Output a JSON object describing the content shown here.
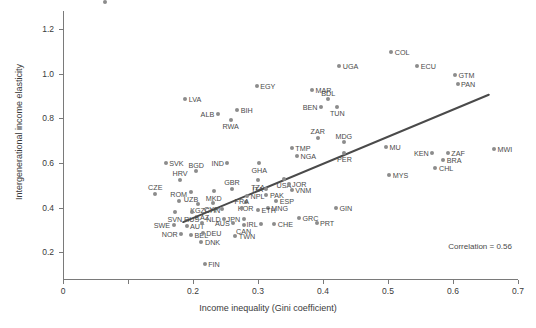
{
  "chart_data": {
    "type": "scatter",
    "title": "",
    "xlabel": "Income inequality (Gini coefficient)",
    "ylabel": "Intergenerational income elasticity",
    "xlim": [
      0.0,
      0.7
    ],
    "ylim": [
      0.08,
      1.28
    ],
    "xticks": [
      0.0,
      0.1,
      0.2,
      0.3,
      0.4,
      0.5,
      0.6,
      0.7
    ],
    "xtick_labels": [
      "0",
      "",
      "0.2",
      "0.3",
      "0.4",
      "0.5",
      "0.6",
      "0.7"
    ],
    "yticks": [
      0.2,
      0.4,
      0.6,
      0.8,
      1.0,
      1.2
    ],
    "ytick_labels": [
      "0.2",
      "0.4",
      "0.6",
      "0.8",
      "1.0",
      "1.2"
    ],
    "grid": false,
    "legend": "none",
    "annotation": "Correlation = 0.56",
    "correlation": 0.56,
    "marker_color": "#8c8c8c",
    "trend_color": "#4a4a4a",
    "axis_color": "#7a7a7a",
    "trend_line": {
      "x0": 0.185,
      "y0": 0.335,
      "x1": 0.655,
      "y1": 0.905
    },
    "points": [
      {
        "label": "COL",
        "x": 0.505,
        "y": 1.095,
        "lp": "r"
      },
      {
        "label": "UGA",
        "x": 0.425,
        "y": 1.035,
        "lp": "r"
      },
      {
        "label": "ECU",
        "x": 0.545,
        "y": 1.035,
        "lp": "r"
      },
      {
        "label": "GTM",
        "x": 0.603,
        "y": 0.995,
        "lp": "r"
      },
      {
        "label": "PAN",
        "x": 0.607,
        "y": 0.955,
        "lp": "r"
      },
      {
        "label": "EGY",
        "x": 0.298,
        "y": 0.945,
        "lp": "r"
      },
      {
        "label": "MAR",
        "x": 0.383,
        "y": 0.928,
        "lp": "r"
      },
      {
        "label": "LVA",
        "x": 0.188,
        "y": 0.888,
        "lp": "r"
      },
      {
        "label": "BDL",
        "x": 0.408,
        "y": 0.885,
        "lp": "t"
      },
      {
        "label": "BEN",
        "x": 0.397,
        "y": 0.852,
        "lp": "l"
      },
      {
        "label": "TUN",
        "x": 0.422,
        "y": 0.852,
        "lp": "b"
      },
      {
        "label": "BIH",
        "x": 0.268,
        "y": 0.835,
        "lp": "r"
      },
      {
        "label": "ALB",
        "x": 0.238,
        "y": 0.818,
        "lp": "l"
      },
      {
        "label": "RWA",
        "x": 0.258,
        "y": 0.792,
        "lp": "b"
      },
      {
        "label": "ZAR",
        "x": 0.392,
        "y": 0.712,
        "lp": "t"
      },
      {
        "label": "MDG",
        "x": 0.432,
        "y": 0.692,
        "lp": "t"
      },
      {
        "label": "MU",
        "x": 0.497,
        "y": 0.672,
        "lp": "r"
      },
      {
        "label": "MWI",
        "x": 0.663,
        "y": 0.662,
        "lp": "r"
      },
      {
        "label": "TMP",
        "x": 0.352,
        "y": 0.665,
        "lp": "r"
      },
      {
        "label": "NGA",
        "x": 0.36,
        "y": 0.632,
        "lp": "r"
      },
      {
        "label": "PER",
        "x": 0.433,
        "y": 0.645,
        "lp": "b"
      },
      {
        "label": "KEN",
        "x": 0.568,
        "y": 0.645,
        "lp": "l"
      },
      {
        "label": "ZAF",
        "x": 0.592,
        "y": 0.645,
        "lp": "r"
      },
      {
        "label": "BRA",
        "x": 0.585,
        "y": 0.615,
        "lp": "r"
      },
      {
        "label": "CHL",
        "x": 0.573,
        "y": 0.578,
        "lp": "r"
      },
      {
        "label": "SVK",
        "x": 0.158,
        "y": 0.598,
        "lp": "r"
      },
      {
        "label": "IND",
        "x": 0.253,
        "y": 0.598,
        "lp": "l"
      },
      {
        "label": "GHA",
        "x": 0.302,
        "y": 0.598,
        "lp": "b"
      },
      {
        "label": "BGD",
        "x": 0.205,
        "y": 0.562,
        "lp": "t"
      },
      {
        "label": "MYS",
        "x": 0.502,
        "y": 0.545,
        "lp": "r"
      },
      {
        "label": "HRV",
        "x": 0.18,
        "y": 0.525,
        "lp": "t"
      },
      {
        "label": "TZA",
        "x": 0.3,
        "y": 0.522,
        "lp": "b"
      },
      {
        "label": "USA",
        "x": 0.34,
        "y": 0.528,
        "lp": "b"
      },
      {
        "label": "JOR",
        "x": 0.347,
        "y": 0.505,
        "lp": "r"
      },
      {
        "label": "CZE",
        "x": 0.142,
        "y": 0.462,
        "lp": "t"
      },
      {
        "label": "UZB",
        "x": 0.197,
        "y": 0.468,
        "lp": "b"
      },
      {
        "label": "MKD",
        "x": 0.232,
        "y": 0.472,
        "lp": "b"
      },
      {
        "label": "GBR",
        "x": 0.26,
        "y": 0.485,
        "lp": "t"
      },
      {
        "label": "ITA",
        "x": 0.313,
        "y": 0.483,
        "lp": "l"
      },
      {
        "label": "VNM",
        "x": 0.352,
        "y": 0.48,
        "lp": "r"
      },
      {
        "label": "NPL",
        "x": 0.283,
        "y": 0.452,
        "lp": "r"
      },
      {
        "label": "PAK",
        "x": 0.313,
        "y": 0.455,
        "lp": "r"
      },
      {
        "label": "ROM",
        "x": 0.178,
        "y": 0.43,
        "lp": "t"
      },
      {
        "label": "KGZ",
        "x": 0.207,
        "y": 0.418,
        "lp": "b"
      },
      {
        "label": "CHN",
        "x": 0.23,
        "y": 0.42,
        "lp": "b"
      },
      {
        "label": "KOR",
        "x": 0.281,
        "y": 0.425,
        "lp": "b"
      },
      {
        "label": "ESP",
        "x": 0.328,
        "y": 0.428,
        "lp": "r"
      },
      {
        "label": "MNG",
        "x": 0.315,
        "y": 0.4,
        "lp": "r"
      },
      {
        "label": "CYP",
        "x": 0.245,
        "y": 0.392,
        "lp": "l"
      },
      {
        "label": "FRA",
        "x": 0.275,
        "y": 0.4,
        "lp": "t"
      },
      {
        "label": "ETH",
        "x": 0.3,
        "y": 0.388,
        "lp": "r"
      },
      {
        "label": "SVN",
        "x": 0.172,
        "y": 0.378,
        "lp": "b"
      },
      {
        "label": "RUS",
        "x": 0.198,
        "y": 0.378,
        "lp": "b"
      },
      {
        "label": "GIN",
        "x": 0.42,
        "y": 0.398,
        "lp": "r"
      },
      {
        "label": "NLD",
        "x": 0.248,
        "y": 0.348,
        "lp": "l"
      },
      {
        "label": "JPN",
        "x": 0.278,
        "y": 0.348,
        "lp": "l"
      },
      {
        "label": "GRC",
        "x": 0.363,
        "y": 0.355,
        "lp": "r"
      },
      {
        "label": "PRT",
        "x": 0.39,
        "y": 0.332,
        "lp": "r"
      },
      {
        "label": "SWE",
        "x": 0.17,
        "y": 0.322,
        "lp": "l"
      },
      {
        "label": "AUT",
        "x": 0.19,
        "y": 0.318,
        "lp": "r"
      },
      {
        "label": "KAZ",
        "x": 0.214,
        "y": 0.33,
        "lp": "t"
      },
      {
        "label": "AUS",
        "x": 0.262,
        "y": 0.33,
        "lp": "l"
      },
      {
        "label": "CAN",
        "x": 0.278,
        "y": 0.322,
        "lp": "b"
      },
      {
        "label": "IRL",
        "x": 0.305,
        "y": 0.325,
        "lp": "l"
      },
      {
        "label": "CHE",
        "x": 0.325,
        "y": 0.325,
        "lp": "r"
      },
      {
        "label": "NOR",
        "x": 0.182,
        "y": 0.282,
        "lp": "l"
      },
      {
        "label": "BEL",
        "x": 0.197,
        "y": 0.278,
        "lp": "r"
      },
      {
        "label": "DEU",
        "x": 0.215,
        "y": 0.288,
        "lp": "r"
      },
      {
        "label": "TWN",
        "x": 0.265,
        "y": 0.272,
        "lp": "r"
      },
      {
        "label": "DNK",
        "x": 0.213,
        "y": 0.245,
        "lp": "r"
      },
      {
        "label": "FIN",
        "x": 0.218,
        "y": 0.148,
        "lp": "r"
      }
    ]
  }
}
